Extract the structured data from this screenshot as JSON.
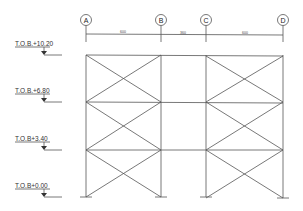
{
  "diagram": {
    "type": "structural-elevation-braced-frame",
    "grid_lines": [
      {
        "id": "A",
        "x": 86
      },
      {
        "id": "B",
        "x": 161
      },
      {
        "id": "C",
        "x": 206
      },
      {
        "id": "D",
        "x": 283
      }
    ],
    "dimensions": [
      {
        "from": "A",
        "to": "B",
        "label": "600"
      },
      {
        "from": "B",
        "to": "C",
        "label": "360"
      },
      {
        "from": "C",
        "to": "D",
        "label": "600"
      }
    ],
    "levels": [
      {
        "label": "T.O.B.+10.20",
        "y": 55
      },
      {
        "label": "T.O.B.+6.80",
        "y": 102
      },
      {
        "label": "T.O.B+3.40",
        "y": 150
      },
      {
        "label": "T.O.B+0.00",
        "y": 197
      }
    ],
    "braced_bays": [
      "A-B",
      "C-D"
    ],
    "line_color": "#555555"
  }
}
